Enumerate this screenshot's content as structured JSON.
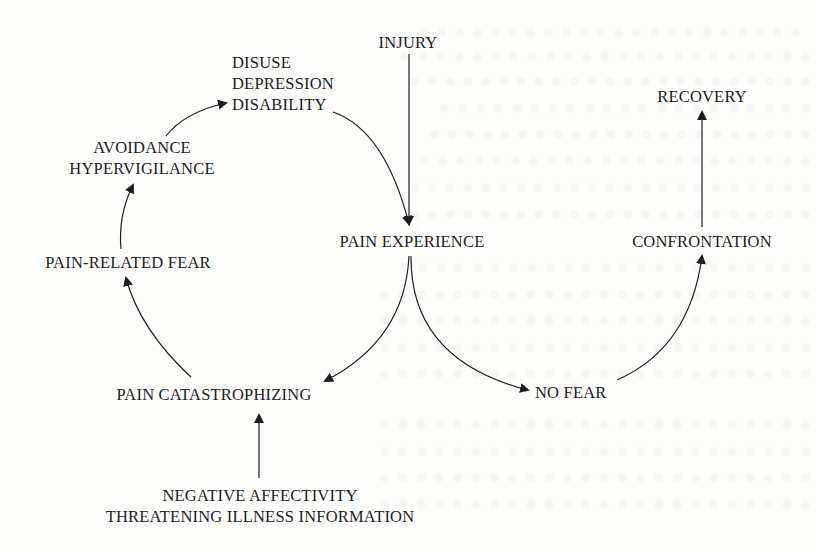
{
  "diagram": {
    "title": "",
    "nodes": {
      "injury": {
        "lines": [
          "INJURY"
        ]
      },
      "disuse": {
        "lines": [
          "DISUSE",
          "DEPRESSION",
          "DISABILITY"
        ]
      },
      "recovery": {
        "lines": [
          "RECOVERY"
        ]
      },
      "avoidance": {
        "lines": [
          "AVOIDANCE",
          "HYPERVIGILANCE"
        ]
      },
      "pain_experience": {
        "lines": [
          "PAIN EXPERIENCE"
        ]
      },
      "confrontation": {
        "lines": [
          "CONFRONTATION"
        ]
      },
      "pain_related_fear": {
        "lines": [
          "PAIN-RELATED FEAR"
        ]
      },
      "pain_catastrophizing": {
        "lines": [
          "PAIN CATASTROPHIZING"
        ]
      },
      "no_fear": {
        "lines": [
          "NO FEAR"
        ]
      },
      "negative_affectivity": {
        "lines": [
          "NEGATIVE AFFECTIVITY",
          "THREATENING ILLNESS INFORMATION"
        ]
      }
    },
    "edges": [
      {
        "from": "INJURY",
        "to": "PAIN EXPERIENCE",
        "style": "straight"
      },
      {
        "from": "DISABILITY",
        "to": "PAIN EXPERIENCE",
        "style": "curved"
      },
      {
        "from": "PAIN EXPERIENCE",
        "to": "PAIN CATASTROPHIZING",
        "style": "curved"
      },
      {
        "from": "PAIN EXPERIENCE",
        "to": "NO FEAR",
        "style": "curved"
      },
      {
        "from": "PAIN CATASTROPHIZING",
        "to": "PAIN-RELATED FEAR",
        "style": "curved"
      },
      {
        "from": "PAIN-RELATED FEAR",
        "to": "AVOIDANCE / HYPERVIGILANCE",
        "style": "curved"
      },
      {
        "from": "AVOIDANCE / HYPERVIGILANCE",
        "to": "DISUSE / DEPRESSION / DISABILITY",
        "style": "curved"
      },
      {
        "from": "NEGATIVE AFFECTIVITY / THREATENING ILLNESS INFORMATION",
        "to": "PAIN CATASTROPHIZING",
        "style": "straight"
      },
      {
        "from": "NO FEAR",
        "to": "CONFRONTATION",
        "style": "curved"
      },
      {
        "from": "CONFRONTATION",
        "to": "RECOVERY",
        "style": "straight"
      }
    ],
    "colors": {
      "ink": "#1e1e1e",
      "background": "#fdfdfc"
    }
  }
}
